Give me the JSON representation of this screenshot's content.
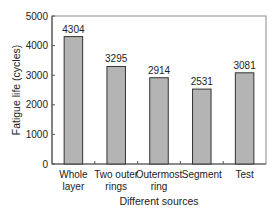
{
  "chart_data": {
    "type": "bar",
    "title": "",
    "xlabel": "Different sources",
    "ylabel": "Fatigue life (cycles)",
    "ylim": [
      0,
      5000
    ],
    "yticks": [
      0,
      1000,
      2000,
      3000,
      4000,
      5000
    ],
    "categories": [
      [
        "Whole",
        "layer"
      ],
      [
        "Two outer",
        "rings"
      ],
      [
        "Outermost",
        "ring"
      ],
      [
        "Segment"
      ],
      [
        "Test"
      ]
    ],
    "values": [
      4304,
      3295,
      2914,
      2531,
      3081
    ],
    "data_labels": [
      "4304",
      "3295",
      "2914",
      "2531",
      "3081"
    ],
    "grid": false,
    "legend": null
  },
  "colors": {
    "bar_fill": "#b4b4b4",
    "bar_stroke": "#333333",
    "axis": "#555555",
    "frame": "#888888"
  }
}
